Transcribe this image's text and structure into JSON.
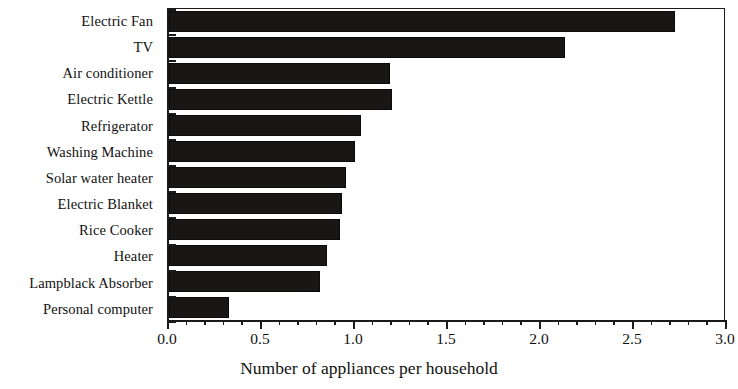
{
  "chart_data": {
    "type": "bar",
    "orientation": "horizontal",
    "title": "",
    "xlabel": "Number of appliances per household",
    "ylabel": "",
    "xlim": [
      0.0,
      3.0
    ],
    "x_major_ticks": [
      "0.0",
      "0.5",
      "1.0",
      "1.5",
      "2.0",
      "2.5",
      "3.0"
    ],
    "x_major_tick_values": [
      0.0,
      0.5,
      1.0,
      1.5,
      2.0,
      2.5,
      3.0
    ],
    "x_minor_tick_interval": 0.1,
    "grid": false,
    "legend": null,
    "bar_color": "#191616",
    "axis_color": "#1a1a1a",
    "categories": [
      "Electric Fan",
      "TV",
      "Air conditioner",
      "Electric Kettle",
      "Refrigerator",
      "Washing Machine",
      "Solar water heater",
      "Electric Blanket",
      "Rice Cooker",
      "Heater",
      "Lampblack Absorber",
      "Personal computer"
    ],
    "values": [
      2.72,
      2.13,
      1.19,
      1.2,
      1.03,
      1.0,
      0.95,
      0.93,
      0.92,
      0.85,
      0.81,
      0.32
    ]
  }
}
